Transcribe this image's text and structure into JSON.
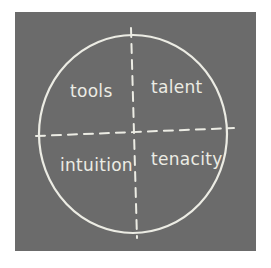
{
  "diagram": {
    "type": "quadrant-circle",
    "style": "chalkboard",
    "colors": {
      "background": "#ffffff",
      "board": "#6b6b6b",
      "chalk": "#ecece4"
    },
    "circle": {
      "cx": 133,
      "cy": 134,
      "rx": 94,
      "ry": 99
    },
    "axes": {
      "horizontal": {
        "x1": 36,
        "y1": 136,
        "x2": 234,
        "y2": 128,
        "style": "dashed"
      },
      "vertical": {
        "x1": 131,
        "y1": 28,
        "x2": 137,
        "y2": 238,
        "style": "dashed"
      }
    },
    "quadrants": [
      {
        "position": "top-left",
        "label": "tools"
      },
      {
        "position": "top-right",
        "label": "talent"
      },
      {
        "position": "bottom-left",
        "label": "intuition"
      },
      {
        "position": "bottom-right",
        "label": "tenacity"
      }
    ]
  }
}
